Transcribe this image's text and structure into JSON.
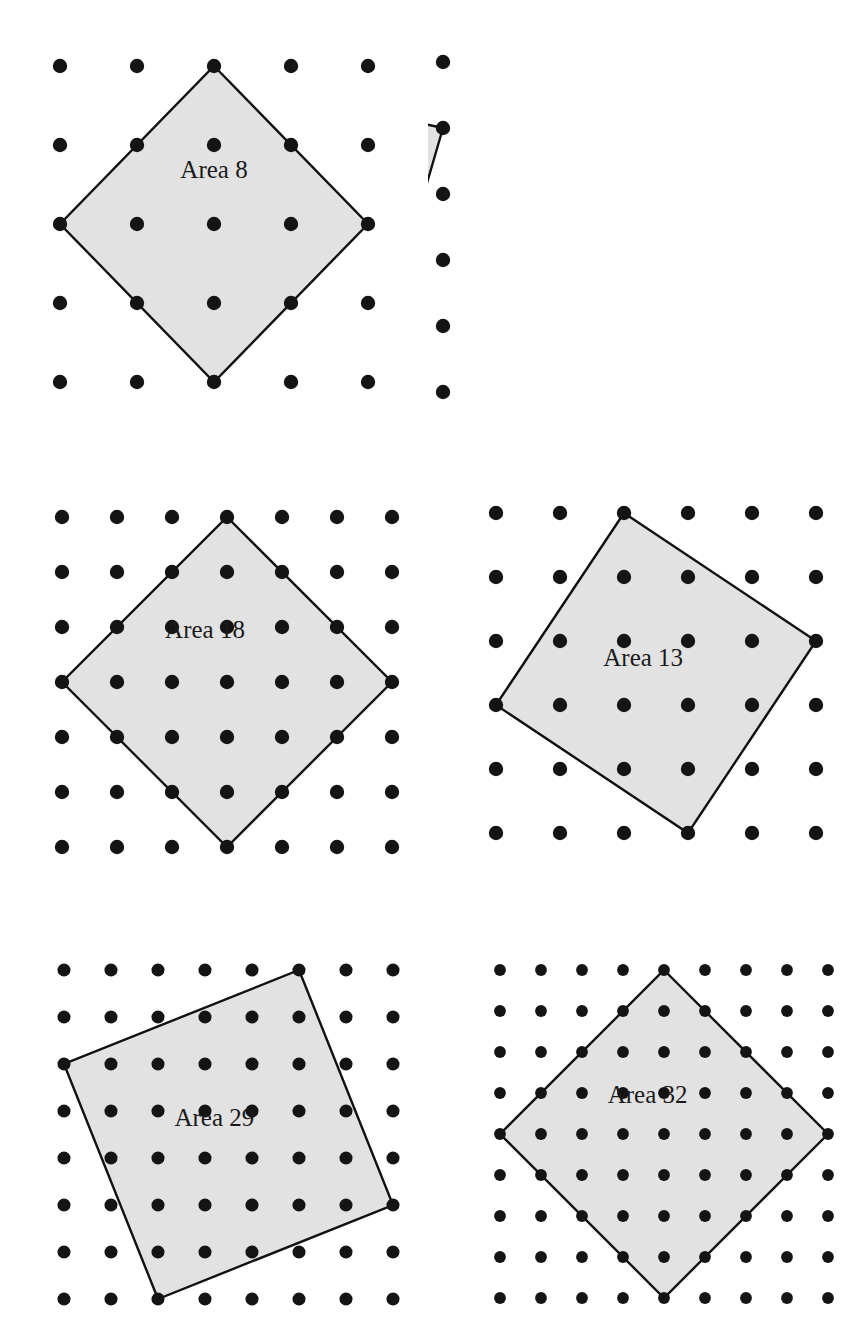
{
  "figure": {
    "background_color": "#ffffff",
    "dot_color": "#141414",
    "polygon_fill": "#e2e2e2",
    "polygon_stroke": "#111111",
    "label_color": "#1a1a1a"
  },
  "chart_data": {
    "type": "scatter",
    "xlabel": "",
    "ylabel": "",
    "grid": true,
    "legend": null,
    "panels": [
      {
        "index": 1,
        "label": "Area 8",
        "area": 8,
        "grid_cols": 5,
        "grid_rows": 5,
        "dot_spacing_x": 77,
        "dot_spacing_y": 79,
        "origin_x": 60,
        "origin_y": 66,
        "vertices": [
          [
            2,
            0
          ],
          [
            4,
            2
          ],
          [
            2,
            4
          ],
          [
            0,
            2
          ]
        ],
        "edge_vector": [
          2,
          2
        ],
        "label_cell": [
          2.0,
          1.35
        ]
      },
      {
        "index": 2,
        "label": "Area 17",
        "area": 17,
        "grid_cols": 6,
        "grid_rows": 6,
        "dot_spacing_x": 77,
        "dot_spacing_y": 66,
        "origin_x": 58,
        "origin_y": 62,
        "vertices": [
          [
            1,
            0
          ],
          [
            5,
            1
          ],
          [
            4,
            5
          ],
          [
            0,
            4
          ]
        ],
        "edge_vector": [
          4,
          1
        ],
        "label_cell": [
          2.6,
          2.3
        ]
      },
      {
        "index": 3,
        "label": "Area 18",
        "area": 18,
        "grid_cols": 7,
        "grid_rows": 7,
        "dot_spacing_x": 55,
        "dot_spacing_y": 55,
        "origin_x": 62,
        "origin_y": 517,
        "vertices": [
          [
            3,
            0
          ],
          [
            6,
            3
          ],
          [
            3,
            6
          ],
          [
            0,
            3
          ]
        ],
        "edge_vector": [
          3,
          3
        ],
        "label_cell": [
          2.6,
          2.1
        ]
      },
      {
        "index": 4,
        "label": "Area 13",
        "area": 13,
        "grid_cols": 6,
        "grid_rows": 6,
        "dot_spacing_x": 64,
        "dot_spacing_y": 64,
        "origin_x": 496,
        "origin_y": 513,
        "vertices": [
          [
            2,
            0
          ],
          [
            5,
            2
          ],
          [
            3,
            5
          ],
          [
            0,
            3
          ]
        ],
        "edge_vector": [
          3,
          2
        ],
        "label_cell": [
          2.3,
          2.3
        ]
      },
      {
        "index": 5,
        "label": "Area 29",
        "area": 29,
        "grid_cols": 8,
        "grid_rows": 8,
        "dot_spacing_x": 47,
        "dot_spacing_y": 47,
        "origin_x": 64,
        "origin_y": 970,
        "vertices": [
          [
            5,
            0
          ],
          [
            7,
            5
          ],
          [
            2,
            7
          ],
          [
            0,
            2
          ]
        ],
        "edge_vector": [
          2,
          5
        ],
        "label_cell": [
          3.2,
          3.2
        ]
      },
      {
        "index": 6,
        "label": "Area 32",
        "area": 32,
        "grid_cols": 9,
        "grid_rows": 9,
        "dot_spacing_x": 41,
        "dot_spacing_y": 41,
        "origin_x": 500,
        "origin_y": 970,
        "vertices": [
          [
            4,
            0
          ],
          [
            8,
            4
          ],
          [
            4,
            8
          ],
          [
            0,
            4
          ]
        ],
        "edge_vector": [
          4,
          4
        ],
        "label_cell": [
          3.6,
          3.1
        ]
      }
    ]
  },
  "panels": [
    {
      "label": "Area 8"
    },
    {
      "label": "Area 17"
    },
    {
      "label": "Area 18"
    },
    {
      "label": "Area 13"
    },
    {
      "label": "Area 29"
    },
    {
      "label": "Area 32"
    }
  ]
}
